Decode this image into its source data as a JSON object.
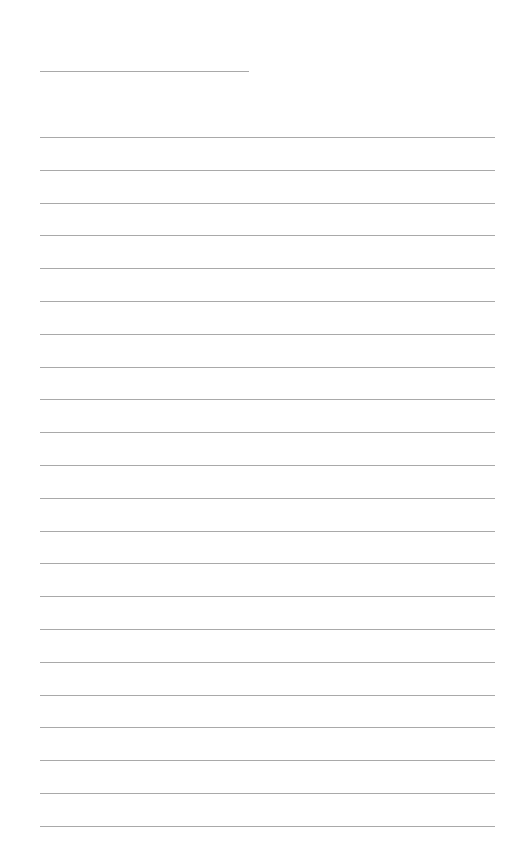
{
  "page": {
    "type": "lined-paper",
    "header_rule": {
      "x": 40,
      "y": 71,
      "width": 209
    },
    "lines": {
      "count": 22,
      "start_y": 137,
      "spacing": 32.8,
      "x": 40,
      "width": 455
    },
    "line_color": "#a9a9a9",
    "background": "#ffffff"
  }
}
